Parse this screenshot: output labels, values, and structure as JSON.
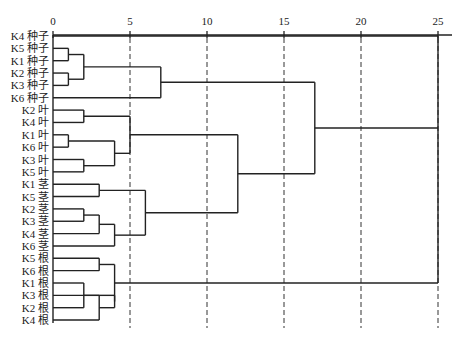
{
  "chart_data": {
    "type": "dendrogram",
    "title": "",
    "xlabel": "",
    "ylabel": "",
    "xlim": [
      0,
      25
    ],
    "x_ticks": [
      0,
      5,
      10,
      15,
      20,
      25
    ],
    "grid": "vertical dashed at 5,10,15,20,25",
    "leaves": [
      "K4 种子",
      "K5 种子",
      "K1 种子",
      "K2 种子",
      "K3 种子",
      "K6 种子",
      "K2 叶",
      "K4 叶",
      "K1 叶",
      "K6 叶",
      "K3 叶",
      "K5 叶",
      "K1 茎",
      "K5 茎",
      "K2 茎",
      "K3 茎",
      "K4 茎",
      "K6 茎",
      "K5 根",
      "K6 根",
      "K1 根",
      "K3 根",
      "K2 根",
      "K4 根"
    ],
    "merges": [
      {
        "id": "s1",
        "children": [
          "K5 种子",
          "K1 种子"
        ],
        "height": 1.0
      },
      {
        "id": "s2",
        "children": [
          "K2 种子",
          "K3 种子"
        ],
        "height": 1.0
      },
      {
        "id": "s3",
        "children": [
          "s1",
          "s2"
        ],
        "height": 2.0
      },
      {
        "id": "S",
        "children": [
          "s3",
          "K6 种子"
        ],
        "height": 7.0
      },
      {
        "id": "l1",
        "children": [
          "K2 叶",
          "K4 叶"
        ],
        "height": 2.0
      },
      {
        "id": "l2",
        "children": [
          "K1 叶",
          "K6 叶"
        ],
        "height": 1.0
      },
      {
        "id": "l3",
        "children": [
          "K3 叶",
          "K5 叶"
        ],
        "height": 2.0
      },
      {
        "id": "l4",
        "children": [
          "l2",
          "l3"
        ],
        "height": 4.0
      },
      {
        "id": "L",
        "children": [
          "l1",
          "l4"
        ],
        "height": 5.0
      },
      {
        "id": "t1",
        "children": [
          "K1 茎",
          "K5 茎"
        ],
        "height": 3.0
      },
      {
        "id": "t2",
        "children": [
          "K2 茎",
          "K3 茎"
        ],
        "height": 2.0
      },
      {
        "id": "t3",
        "children": [
          "t2",
          "K4 茎"
        ],
        "height": 3.0
      },
      {
        "id": "t4",
        "children": [
          "t3",
          "K6 茎"
        ],
        "height": 4.0
      },
      {
        "id": "T",
        "children": [
          "t1",
          "t4"
        ],
        "height": 6.0
      },
      {
        "id": "LT",
        "children": [
          "L",
          "T"
        ],
        "height": 12.0
      },
      {
        "id": "SLT",
        "children": [
          "S",
          "LT"
        ],
        "height": 17.0
      },
      {
        "id": "r1",
        "children": [
          "K5 根",
          "K6 根"
        ],
        "height": 3.0
      },
      {
        "id": "r2",
        "children": [
          "K1 根",
          "K2 根"
        ],
        "height": 2.0
      },
      {
        "id": "r3",
        "children": [
          "K3 根",
          "K4 根"
        ],
        "height": 3.0
      },
      {
        "id": "r4",
        "children": [
          "r2",
          "r3"
        ],
        "height": 4.0
      },
      {
        "id": "R",
        "children": [
          "r1",
          "r4"
        ],
        "height": 4.0
      },
      {
        "id": "ALL",
        "children": [
          "SLT",
          "R",
          "K4 种子"
        ],
        "height": 25.0
      }
    ]
  }
}
